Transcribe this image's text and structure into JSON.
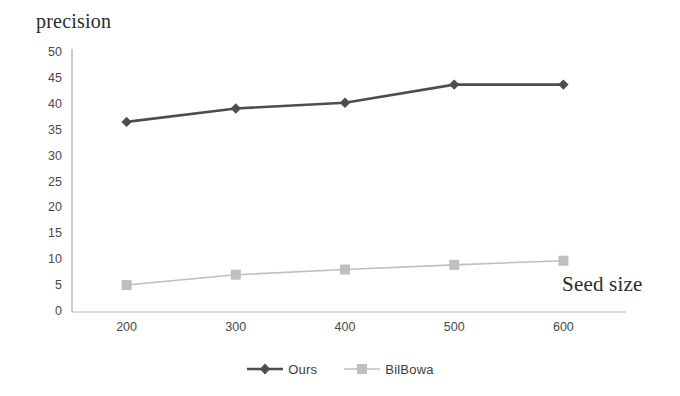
{
  "chart_data": {
    "type": "line",
    "title": "",
    "xlabel": "Seed size",
    "ylabel": "precision",
    "x": [
      200,
      300,
      400,
      500,
      600
    ],
    "categories": [
      "200",
      "300",
      "400",
      "500",
      "600"
    ],
    "series": [
      {
        "name": "Ours",
        "values": [
          36.7,
          39.3,
          40.4,
          43.9,
          43.9
        ],
        "color": "#4d4d4d",
        "marker": "diamond"
      },
      {
        "name": "BilBowa",
        "values": [
          5.2,
          7.2,
          8.2,
          9.1,
          9.9
        ],
        "color": "#bfbfbf",
        "marker": "square"
      }
    ],
    "ylim": [
      0,
      50
    ],
    "ytick_labels": [
      "50",
      "45",
      "40",
      "35",
      "30",
      "25",
      "20",
      "15",
      "10",
      "5",
      "0"
    ],
    "ytick_values": [
      50,
      45,
      40,
      35,
      30,
      25,
      20,
      15,
      10,
      5,
      0
    ],
    "xtick_labels": [
      "200",
      "300",
      "400",
      "500",
      "600"
    ],
    "grid": false,
    "legend_position": "bottom",
    "legend": [
      "Ours",
      "BilBowa"
    ],
    "axis_color": "#b5b5b5"
  },
  "axes": {
    "y_title": "precision",
    "x_title": "Seed size"
  },
  "legend": {
    "entries": [
      {
        "label": "Ours",
        "icon": "diamond-marker-icon"
      },
      {
        "label": "BilBowa",
        "icon": "square-marker-icon"
      }
    ]
  }
}
